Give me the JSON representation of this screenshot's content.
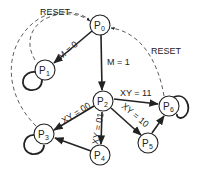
{
  "diagram": {
    "type": "state-diagram",
    "nodes": [
      {
        "id": "P0",
        "main": "P",
        "sub": "0"
      },
      {
        "id": "P1",
        "main": "P",
        "sub": "1"
      },
      {
        "id": "P2",
        "main": "P",
        "sub": "2"
      },
      {
        "id": "P3",
        "main": "P",
        "sub": "3"
      },
      {
        "id": "P4",
        "main": "P",
        "sub": "4"
      },
      {
        "id": "P5",
        "main": "P",
        "sub": "5"
      },
      {
        "id": "P6",
        "main": "P",
        "sub": "6"
      }
    ],
    "edges": [
      {
        "from": "P0",
        "to": "P1",
        "label": "M = 0",
        "style": "solid"
      },
      {
        "from": "P0",
        "to": "P2",
        "label": "M = 1",
        "style": "solid"
      },
      {
        "from": "P2",
        "to": "P3",
        "label": "XY = 00",
        "style": "solid"
      },
      {
        "from": "P2",
        "to": "P4",
        "label": "XY = 01",
        "style": "solid"
      },
      {
        "from": "P2",
        "to": "P5",
        "label": "XY = 10",
        "style": "solid"
      },
      {
        "from": "P2",
        "to": "P6",
        "label": "XY = 11",
        "style": "solid"
      },
      {
        "from": "P4",
        "to": "P3",
        "label": "",
        "style": "solid"
      },
      {
        "from": "P5",
        "to": "P6",
        "label": "",
        "style": "solid"
      },
      {
        "from": "P1",
        "to": "P0",
        "label": "RESET",
        "style": "dashed"
      },
      {
        "from": "P3",
        "to": "P0",
        "label": "",
        "style": "dashed"
      },
      {
        "from": "P6",
        "to": "P0",
        "label": "RESET",
        "style": "dashed"
      },
      {
        "from": "P1",
        "to": "P1",
        "label": "",
        "style": "self-loop"
      },
      {
        "from": "P3",
        "to": "P3",
        "label": "",
        "style": "self-loop"
      },
      {
        "from": "P6",
        "to": "P6",
        "label": "",
        "style": "self-loop"
      }
    ],
    "labels": {
      "reset_left": "RESET",
      "reset_right": "RESET",
      "m0": "M = 0",
      "m1": "M = 1",
      "xy00": "XY = 00",
      "xy01": "XY = 01",
      "xy10": "XY = 10",
      "xy11": "XY = 11"
    }
  }
}
